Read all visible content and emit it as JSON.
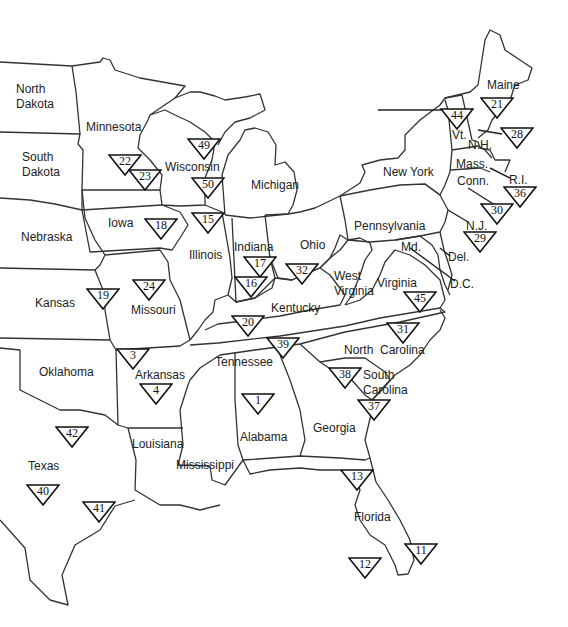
{
  "map": {
    "title": "Eastern United States",
    "states": [
      {
        "id": "north-dakota",
        "label": "North\nDakota",
        "x": 16,
        "y": 82
      },
      {
        "id": "south-dakota",
        "label": "South\nDakota",
        "x": 22,
        "y": 150
      },
      {
        "id": "minnesota",
        "label": "Minnesota",
        "x": 86,
        "y": 120
      },
      {
        "id": "wisconsin",
        "label": "Wisconsin",
        "x": 165,
        "y": 160
      },
      {
        "id": "michigan",
        "label": "Michigan",
        "x": 251,
        "y": 178
      },
      {
        "id": "nebraska",
        "label": "Nebraska",
        "x": 21,
        "y": 230
      },
      {
        "id": "iowa",
        "label": "Iowa",
        "x": 108,
        "y": 216
      },
      {
        "id": "illinois",
        "label": "Illinois",
        "x": 189,
        "y": 248
      },
      {
        "id": "indiana",
        "label": "Indiana",
        "x": 234,
        "y": 240
      },
      {
        "id": "ohio",
        "label": "Ohio",
        "x": 300,
        "y": 238
      },
      {
        "id": "pennsylvania",
        "label": "Pennsylvania",
        "x": 354,
        "y": 219
      },
      {
        "id": "new-york",
        "label": "New York",
        "x": 383,
        "y": 165
      },
      {
        "id": "kansas",
        "label": "Kansas",
        "x": 35,
        "y": 296
      },
      {
        "id": "missouri",
        "label": "Missouri",
        "x": 131,
        "y": 303
      },
      {
        "id": "kentucky",
        "label": "Kentucky",
        "x": 271,
        "y": 301
      },
      {
        "id": "west-virginia",
        "label": "West\nVirginia",
        "x": 334,
        "y": 269
      },
      {
        "id": "virginia",
        "label": "Virginia",
        "x": 377,
        "y": 276
      },
      {
        "id": "oklahoma",
        "label": "Oklahoma",
        "x": 39,
        "y": 365
      },
      {
        "id": "arkansas",
        "label": "Arkansas",
        "x": 135,
        "y": 368
      },
      {
        "id": "tennessee",
        "label": "Tennessee",
        "x": 215,
        "y": 355
      },
      {
        "id": "north-carolina",
        "label": "North  Carolina",
        "x": 344,
        "y": 343
      },
      {
        "id": "south-carolina",
        "label": "South\nCarolina",
        "x": 363,
        "y": 368
      },
      {
        "id": "georgia",
        "label": "Georgia",
        "x": 313,
        "y": 421
      },
      {
        "id": "alabama",
        "label": "Alabama",
        "x": 240,
        "y": 430
      },
      {
        "id": "mississippi",
        "label": "Mississippi",
        "x": 176,
        "y": 458
      },
      {
        "id": "louisiana",
        "label": "Louisiana",
        "x": 132,
        "y": 437
      },
      {
        "id": "texas",
        "label": "Texas",
        "x": 28,
        "y": 459
      },
      {
        "id": "florida",
        "label": "Florida",
        "x": 354,
        "y": 510
      },
      {
        "id": "maine",
        "label": "Maine",
        "x": 487,
        "y": 78
      },
      {
        "id": "vermont",
        "label": "Vt.",
        "x": 452,
        "y": 128
      },
      {
        "id": "new-hampshire",
        "label": "N.H.",
        "x": 468,
        "y": 138
      },
      {
        "id": "massachusetts",
        "label": "Mass.",
        "x": 456,
        "y": 157
      },
      {
        "id": "connecticut",
        "label": "Conn.",
        "x": 457,
        "y": 174
      },
      {
        "id": "rhode-island",
        "label": "R.I.",
        "x": 509,
        "y": 173
      },
      {
        "id": "new-jersey",
        "label": "N.J.",
        "x": 466,
        "y": 219
      },
      {
        "id": "maryland",
        "label": "Md.",
        "x": 401,
        "y": 240
      },
      {
        "id": "delaware",
        "label": "Del.",
        "x": 448,
        "y": 250
      },
      {
        "id": "dc",
        "label": "D.C.",
        "x": 450,
        "y": 277
      }
    ],
    "markers": [
      {
        "number": "1",
        "x": 241,
        "y": 393
      },
      {
        "number": "3",
        "x": 116,
        "y": 348
      },
      {
        "number": "4",
        "x": 139,
        "y": 383
      },
      {
        "number": "11",
        "x": 404,
        "y": 543
      },
      {
        "number": "12",
        "x": 348,
        "y": 557
      },
      {
        "number": "13",
        "x": 340,
        "y": 469
      },
      {
        "number": "15",
        "x": 191,
        "y": 212
      },
      {
        "number": "16",
        "x": 234,
        "y": 276
      },
      {
        "number": "17",
        "x": 243,
        "y": 256
      },
      {
        "number": "18",
        "x": 144,
        "y": 218
      },
      {
        "number": "19",
        "x": 86,
        "y": 288
      },
      {
        "number": "20",
        "x": 231,
        "y": 315
      },
      {
        "number": "21",
        "x": 480,
        "y": 97
      },
      {
        "number": "22",
        "x": 108,
        "y": 154
      },
      {
        "number": "23",
        "x": 128,
        "y": 169
      },
      {
        "number": "24",
        "x": 132,
        "y": 279
      },
      {
        "number": "28",
        "x": 500,
        "y": 127
      },
      {
        "number": "29",
        "x": 463,
        "y": 231
      },
      {
        "number": "30",
        "x": 480,
        "y": 203
      },
      {
        "number": "31",
        "x": 386,
        "y": 322
      },
      {
        "number": "32",
        "x": 285,
        "y": 263
      },
      {
        "number": "36",
        "x": 503,
        "y": 186
      },
      {
        "number": "37",
        "x": 357,
        "y": 399
      },
      {
        "number": "38",
        "x": 328,
        "y": 367
      },
      {
        "number": "39",
        "x": 266,
        "y": 337
      },
      {
        "number": "40",
        "x": 26,
        "y": 484
      },
      {
        "number": "41",
        "x": 82,
        "y": 501
      },
      {
        "number": "42",
        "x": 55,
        "y": 426
      },
      {
        "number": "44",
        "x": 440,
        "y": 108
      },
      {
        "number": "45",
        "x": 403,
        "y": 291
      },
      {
        "number": "49",
        "x": 187,
        "y": 138
      },
      {
        "number": "50",
        "x": 191,
        "y": 177
      }
    ]
  }
}
